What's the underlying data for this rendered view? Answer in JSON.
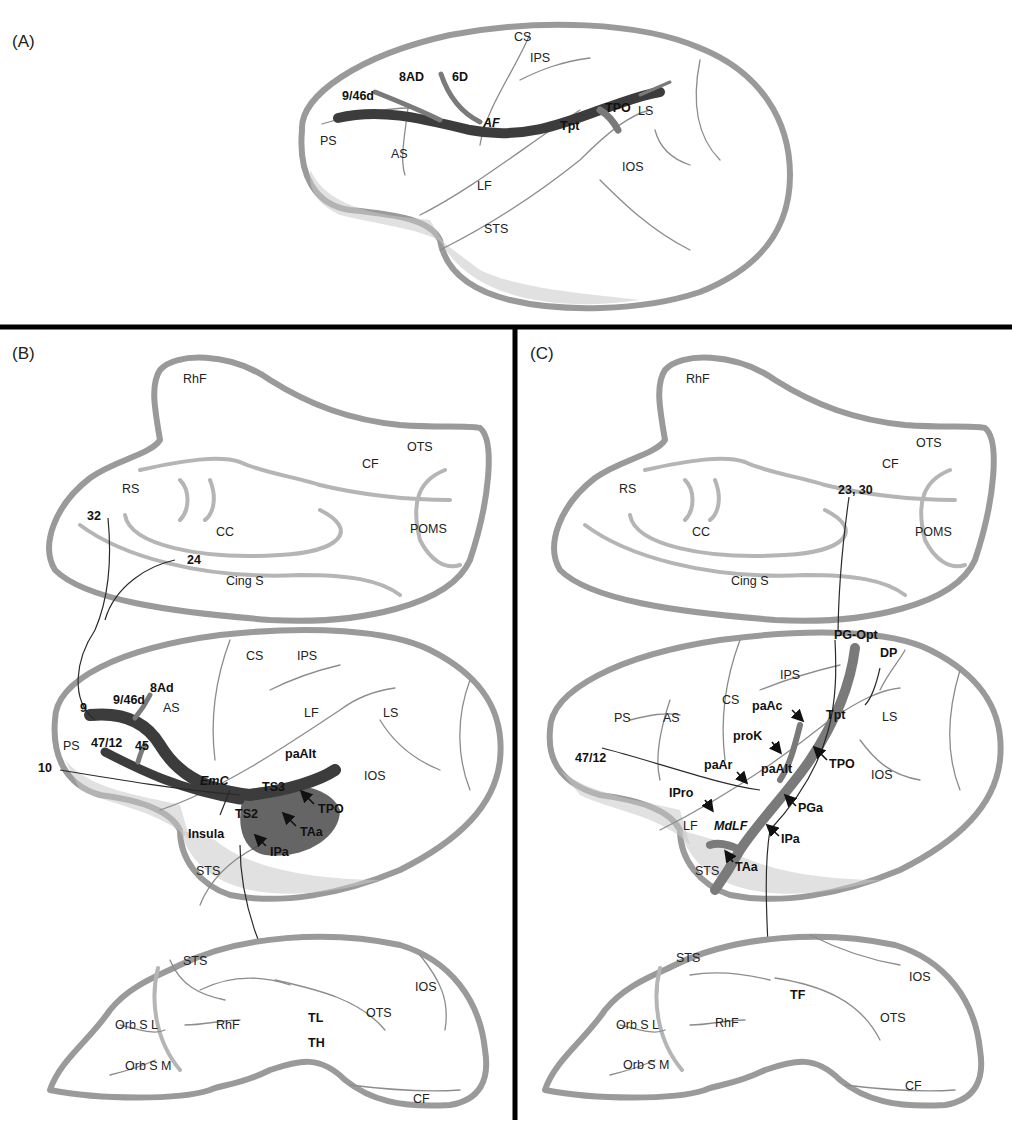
{
  "figure": {
    "panels": [
      {
        "id": "A",
        "label": "(A)",
        "view": "lateral",
        "tract": "AF",
        "sulci": [
          "CS",
          "IPS",
          "PS",
          "AS",
          "LF",
          "STS",
          "LS",
          "IOS"
        ],
        "areas": [
          "9/46d",
          "8AD",
          "6D",
          "Tpt",
          "TPO"
        ]
      },
      {
        "id": "B",
        "label": "(B)",
        "medial": {
          "sulci": [
            "RhF",
            "OTS",
            "CF",
            "RS",
            "CC",
            "POMS",
            "Cing S"
          ],
          "areas": [
            "32",
            "24"
          ]
        },
        "lateral": {
          "tract": "EmC",
          "sulci": [
            "CS",
            "IPS",
            "AS",
            "LF",
            "LS",
            "PS",
            "IOS",
            "STS"
          ],
          "areas": [
            "8Ad",
            "9/46d",
            "9",
            "47/12",
            "45",
            "10",
            "paAlt",
            "TS3",
            "TPO",
            "TS2",
            "TAa",
            "Insula",
            "IPa"
          ]
        },
        "ventral": {
          "sulci": [
            "STS",
            "IOS",
            "OTS",
            "Orb S L",
            "RhF",
            "Orb S M",
            "CF"
          ],
          "areas": [
            "TL",
            "TH"
          ]
        }
      },
      {
        "id": "C",
        "label": "(C)",
        "medial": {
          "sulci": [
            "RhF",
            "OTS",
            "CF",
            "RS",
            "CC",
            "POMS",
            "Cing S"
          ],
          "areas": [
            "23, 30"
          ]
        },
        "lateral": {
          "tract": "MdLF",
          "sulci": [
            "IPS",
            "PS",
            "AS",
            "CS",
            "LS",
            "IOS",
            "LF",
            "STS"
          ],
          "areas": [
            "PG-Opt",
            "DP",
            "paAc",
            "Tpt",
            "proK",
            "47/12",
            "paAr",
            "paAlt",
            "TPO",
            "IPro",
            "PGa",
            "IPa",
            "TAa"
          ]
        },
        "ventral": {
          "sulci": [
            "STS",
            "IOS",
            "OTS",
            "Orb S L",
            "RhF",
            "Orb S M",
            "CF"
          ],
          "areas": [
            "TF"
          ]
        }
      }
    ]
  },
  "labels": {
    "A": {
      "panel": "(A)",
      "CS": "CS",
      "IPS": "IPS",
      "d946": "9/46d",
      "AD8": "8AD",
      "D6": "6D",
      "PS": "PS",
      "AS": "AS",
      "AF": "AF",
      "Tpt": "Tpt",
      "TPO": "TPO",
      "LS": "LS",
      "IOS": "IOS",
      "LF": "LF",
      "STS": "STS"
    },
    "B": {
      "panel": "(B)",
      "m_RhF": "RhF",
      "m_OTS": "OTS",
      "m_CF": "CF",
      "m_RS": "RS",
      "m_32": "32",
      "m_CC": "CC",
      "m_POMS": "POMS",
      "m_24": "24",
      "m_Cing": "Cing S",
      "l_CS": "CS",
      "l_IPS": "IPS",
      "l_8Ad": "8Ad",
      "l_946d": "9/46d",
      "l_9": "9",
      "l_AS": "AS",
      "l_LF": "LF",
      "l_LS": "LS",
      "l_PS": "PS",
      "l_4712": "47/12",
      "l_45": "45",
      "l_paAlt": "paAlt",
      "l_10": "10",
      "l_IOS": "IOS",
      "l_EmC": "EmC",
      "l_TS3": "TS3",
      "l_TPO": "TPO",
      "l_Insula": "Insula",
      "l_TS2": "TS2",
      "l_TAa": "TAa",
      "l_IPa": "IPa",
      "l_STS": "STS",
      "v_STS": "STS",
      "v_IOS": "IOS",
      "v_OTS": "OTS",
      "v_OrbSL": "Orb S L",
      "v_RhF": "RhF",
      "v_TL": "TL",
      "v_TH": "TH",
      "v_OrbSM": "Orb S M",
      "v_CF": "CF"
    },
    "C": {
      "panel": "(C)",
      "m_RhF": "RhF",
      "m_OTS": "OTS",
      "m_CF": "CF",
      "m_RS": "RS",
      "m_2330": "23, 30",
      "m_CC": "CC",
      "m_POMS": "POMS",
      "m_Cing": "Cing S",
      "l_PGOpt": "PG-Opt",
      "l_DP": "DP",
      "l_IPS": "IPS",
      "l_PS": "PS",
      "l_AS": "AS",
      "l_CS": "CS",
      "l_paAc": "paAc",
      "l_Tpt": "Tpt",
      "l_LS": "LS",
      "l_proK": "proK",
      "l_4712": "47/12",
      "l_paAr": "paAr",
      "l_paAlt": "paAlt",
      "l_TPO": "TPO",
      "l_IOS": "IOS",
      "l_IPro": "IPro",
      "l_PGa": "PGa",
      "l_LF": "LF",
      "l_MdLF": "MdLF",
      "l_IPa": "IPa",
      "l_TAa": "TAa",
      "l_STS": "STS",
      "v_STS": "STS",
      "v_IOS": "IOS",
      "v_TF": "TF",
      "v_OrbSL": "Orb S L",
      "v_RhF": "RhF",
      "v_OTS": "OTS",
      "v_OrbSM": "Orb S M",
      "v_CF": "CF"
    }
  }
}
